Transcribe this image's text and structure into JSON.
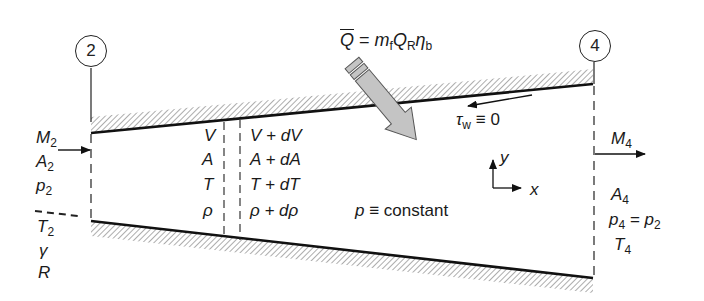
{
  "figure": {
    "heat_equation": {
      "lhs": "Q",
      "eq": " = ",
      "m": "m",
      "m_sub": "f",
      "q": "Q",
      "q_sub": "R",
      "eta": "η",
      "eta_sub": "b"
    },
    "stations": [
      {
        "id": "station-2",
        "label": "2"
      },
      {
        "id": "station-4",
        "label": "4"
      }
    ],
    "inlet_props": [
      {
        "sym": "M",
        "sub": "2"
      },
      {
        "sym": "A",
        "sub": "2"
      },
      {
        "sym": "p",
        "sub": "2"
      },
      {
        "sym": "T",
        "sub": "2"
      },
      {
        "sym": "γ",
        "sub": ""
      },
      {
        "sym": "R",
        "sub": ""
      }
    ],
    "cv_left": [
      "V",
      "A",
      "T",
      "ρ"
    ],
    "cv_right": [
      "V + dV",
      "A + dA",
      "T + dT",
      "ρ + dρ"
    ],
    "pressure_note": {
      "sym": "p",
      "text": " ≡ constant"
    },
    "wall_shear": {
      "sym": "τ",
      "sub": "w",
      "text": " ≡ 0"
    },
    "axes": {
      "x": "x",
      "y": "y"
    },
    "outlet_props": {
      "M": {
        "sym": "M",
        "sub": "4"
      },
      "A": {
        "sym": "A",
        "sub": "4"
      },
      "p_lhs": {
        "sym": "p",
        "sub": "4"
      },
      "p_eq": " = ",
      "p_rhs": {
        "sym": "p",
        "sub": "2"
      },
      "T": {
        "sym": "T",
        "sub": "4"
      }
    },
    "colors": {
      "line": "#111111",
      "hatch": "#8a8a8a",
      "heat_arrow_fill": "#c4c4c4",
      "heat_arrow_stroke": "#555555"
    }
  }
}
